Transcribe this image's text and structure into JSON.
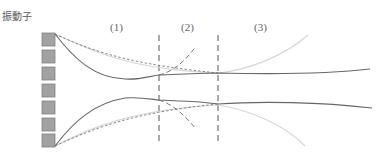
{
  "title": "振動子",
  "regions": [
    {
      "label": "(1)",
      "x": 110
    },
    {
      "label": "(2)",
      "x": 181
    },
    {
      "label": "(3)",
      "x": 254
    }
  ],
  "oscillators": {
    "count": 7,
    "fill": "#a0a0a0",
    "stroke": "#777777"
  },
  "colors": {
    "solid_curve": "#666666",
    "dashed_curve": "#777777",
    "light_curve": "#d4d4d4",
    "divider": "#555555"
  }
}
